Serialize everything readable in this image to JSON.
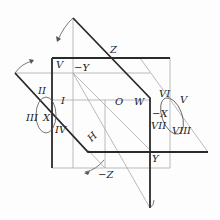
{
  "diagram": {
    "colors": {
      "thick_line": "#2a2a2a",
      "thin_line": "#a8a8a8",
      "arrow": "#555555"
    },
    "labels": {
      "Z": "Z",
      "neg_Z": "−Z",
      "neg_Y": "−Y",
      "Y": "Y",
      "X": "X",
      "neg_X": "−X",
      "O": "O",
      "W": "W",
      "H": "H",
      "I": "I",
      "II": "II",
      "III": "III",
      "IV": "IV",
      "V_left": "V",
      "V_right": "V",
      "VI": "VI",
      "VII": "VII",
      "VIII": "VIII"
    }
  }
}
